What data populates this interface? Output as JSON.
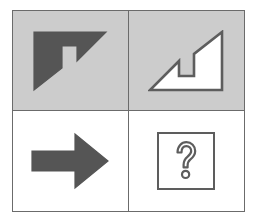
{
  "puzzle": {
    "type": "visual-analogy-matrix",
    "title": "Visual analogy puzzle",
    "grid": {
      "rows": 2,
      "columns": 2
    },
    "colors": {
      "page_background": "#ffffff",
      "frame_border": "#6b6b6b",
      "top_row_cell_background": "#cccccc",
      "bottom_row_cell_background": "#ffffff",
      "shape_fill_dark": "#555555",
      "shape_fill_light": "#ffffff",
      "shape_outline": "#5d5d5d",
      "question_mark_color": "#5d5d5d"
    },
    "cells": [
      {
        "position": "top-left",
        "shape_name": "corner-arrow-up-left-filled",
        "description": "Solid dark gray beveled corner arrow pointing up and left",
        "fill": "#555555",
        "outline": "none",
        "rotation_degrees": 0,
        "background": "#cccccc"
      },
      {
        "position": "top-right",
        "shape_name": "corner-arrow-down-right-outline",
        "description": "White beveled corner arrow pointing down and right with dark outline",
        "fill": "#ffffff",
        "outline": "#5d5d5d",
        "rotation_degrees": 180,
        "background": "#cccccc"
      },
      {
        "position": "bottom-left",
        "shape_name": "block-arrow-right-filled",
        "description": "Solid dark gray block arrow pointing right",
        "fill": "#555555",
        "outline": "none",
        "rotation_degrees": 0,
        "background": "#ffffff"
      },
      {
        "position": "bottom-right",
        "shape_name": "question-box",
        "description": "Square outlined box containing an outlined question mark",
        "fill": "#ffffff",
        "outline": "#5d5d5d",
        "question_mark": "?",
        "background": "#ffffff"
      }
    ],
    "labels": {
      "cell_tl": "Top left figure",
      "cell_tr": "Top right figure",
      "cell_bl": "Bottom left figure",
      "cell_br": "Answer placeholder"
    }
  }
}
